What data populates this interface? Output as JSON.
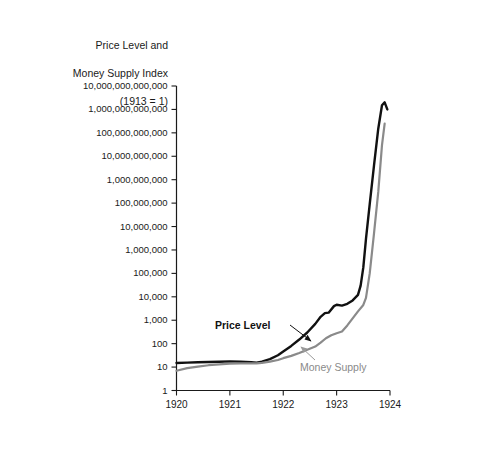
{
  "chart_data": {
    "type": "line",
    "title": "Price Level and Money Supply Index (1913 = 1)",
    "title_lines": [
      "Price Level and",
      "Money Supply Index",
      "(1913 = 1)"
    ],
    "xlabel": "",
    "ylabel": "Price Level and Money Supply Index (1913 = 1)",
    "yscale": "log",
    "ylim": [
      1,
      10000000000000
    ],
    "xlim": [
      1920,
      1924
    ],
    "grid": false,
    "legend_position": "inline-annotations",
    "ytick_labels": [
      "10,000,000,000,000",
      "1,000,000,000,000",
      "100,000,000,000",
      "10,000,000,000",
      "1,000,000,000",
      "100,000,000",
      "10,000,000",
      "1,000,000",
      "100,000",
      "10,000",
      "1,000",
      "100",
      "10",
      "1"
    ],
    "ytick_values": [
      10000000000000,
      1000000000000,
      100000000000,
      10000000000,
      1000000000,
      100000000,
      10000000,
      1000000,
      100000,
      10000,
      1000,
      100,
      10,
      1
    ],
    "xtick_labels": [
      "1920",
      "1921",
      "1922",
      "1923",
      "1924"
    ],
    "xtick_values": [
      1920,
      1921,
      1922,
      1923,
      1924
    ],
    "series": [
      {
        "name": "Price Level",
        "color": "#111111",
        "label_text": "Price Level",
        "x": [
          1920.0,
          1920.2,
          1920.4,
          1920.6,
          1920.8,
          1921.0,
          1921.2,
          1921.4,
          1921.5,
          1921.6,
          1921.75,
          1921.9,
          1922.0,
          1922.15,
          1922.3,
          1922.45,
          1922.6,
          1922.7,
          1922.78,
          1922.85,
          1922.95,
          1923.0,
          1923.1,
          1923.2,
          1923.3,
          1923.4,
          1923.45,
          1923.5,
          1923.55,
          1923.62,
          1923.7,
          1923.78,
          1923.85,
          1923.9,
          1923.95
        ],
        "y": [
          15,
          15.5,
          16,
          16.5,
          17,
          17.5,
          17,
          16,
          15.5,
          17,
          22,
          32,
          46,
          80,
          150,
          300,
          700,
          1400,
          2000,
          2100,
          4000,
          4600,
          4200,
          5000,
          7000,
          12000,
          30000,
          180000,
          3000000,
          90000000,
          4000000000,
          150000000000,
          1500000000000,
          2000000000000,
          1000000000000
        ]
      },
      {
        "name": "Money Supply",
        "color": "#8a8a8a",
        "label_text": "Money Supply",
        "x": [
          1920.0,
          1920.2,
          1920.4,
          1920.6,
          1920.8,
          1921.0,
          1921.2,
          1921.4,
          1921.5,
          1921.6,
          1921.75,
          1921.9,
          1922.0,
          1922.15,
          1922.3,
          1922.45,
          1922.6,
          1922.7,
          1922.8,
          1922.9,
          1923.0,
          1923.1,
          1923.2,
          1923.3,
          1923.4,
          1923.5,
          1923.55,
          1923.62,
          1923.7,
          1923.78,
          1923.85,
          1923.9
        ],
        "y": [
          7,
          9,
          10.5,
          12,
          13,
          14,
          14.5,
          14.5,
          14.5,
          15,
          17,
          20,
          24,
          30,
          40,
          55,
          75,
          110,
          170,
          230,
          280,
          330,
          600,
          1200,
          2400,
          4500,
          9000,
          100000,
          5000000,
          300000000,
          30000000000,
          250000000000
        ]
      }
    ],
    "annotations": [
      {
        "name": "price-level-annotation",
        "text": "Price Level",
        "style": "bold-black",
        "label_x": 215,
        "label_y": 326,
        "leader_from": [
          290,
          326
        ],
        "leader_to": [
          312,
          342
        ]
      },
      {
        "name": "money-supply-annotation",
        "text": "Money Supply",
        "style": "gray",
        "label_x": 300,
        "label_y": 368,
        "leader_from": [
          316,
          361
        ],
        "leader_to": [
          300,
          348
        ]
      }
    ]
  },
  "figure": {
    "background_color": "#ffffff",
    "axis_color": "#1a1a1a",
    "price_color": "#111111",
    "money_color": "#8a8a8a"
  }
}
